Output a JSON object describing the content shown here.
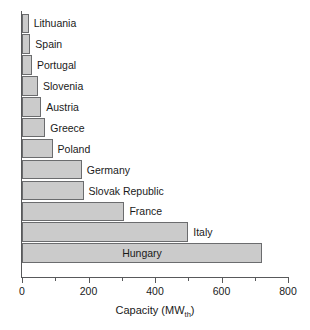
{
  "chart_data": {
    "type": "bar",
    "orientation": "horizontal",
    "title": "",
    "xlabel": "Capacity (MW",
    "xlabel_sub": "th",
    "xlabel_suffix": ")",
    "ylabel": "",
    "xlim": [
      0,
      800
    ],
    "grid": false,
    "legend": null,
    "xticks": [
      0,
      200,
      400,
      600,
      800
    ],
    "xtick_labels": [
      "0",
      "200",
      "400",
      "600",
      "800"
    ],
    "xminorticks": [
      100,
      300,
      500,
      700
    ],
    "categories": [
      "Lithuania",
      "Spain",
      "Portugal",
      "Slovenia",
      "Austria",
      "Greece",
      "Poland",
      "Germany",
      "Slovak Republic",
      "France",
      "Italy",
      "Hungary"
    ],
    "values": [
      20,
      25,
      30,
      48,
      58,
      70,
      92,
      180,
      185,
      308,
      500,
      722
    ],
    "label_placement": [
      "outside",
      "outside",
      "outside",
      "outside",
      "outside",
      "outside",
      "outside",
      "outside",
      "outside",
      "outside",
      "outside",
      "inside"
    ],
    "bar_fill": "#cbcbcb",
    "bar_edge": "#6b6c6e",
    "axis_color": "#58595b",
    "text_color": "#1a1a1a",
    "background": "#ffffff"
  }
}
